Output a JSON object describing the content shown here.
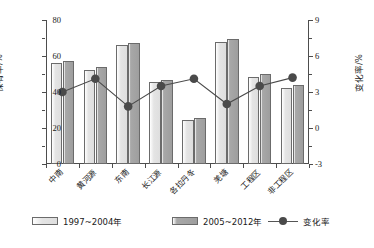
{
  "chart_data": {
    "type": "bar",
    "title": "",
    "xlabel": "",
    "ylabel": "保有率/%",
    "y2label": "变化率/%",
    "categories": [
      "中南",
      "黄河源",
      "东南",
      "长江源",
      "各拉丹冬",
      "羌塘",
      "工程区",
      "非工程区"
    ],
    "ylim": [
      0,
      80
    ],
    "yticks": [
      0,
      20,
      40,
      60,
      80
    ],
    "y2lim": [
      -3,
      9
    ],
    "y2ticks": [
      -3,
      0,
      3,
      6,
      9
    ],
    "grid": false,
    "legend_position": "bottom",
    "series": [
      {
        "name": "1997~2004年",
        "kind": "bar",
        "axis": "left",
        "color": "#e0e0e0",
        "values": [
          56.0,
          52.0,
          66.0,
          45.5,
          24.5,
          68.0,
          48.5,
          42.0
        ]
      },
      {
        "name": "2005~2012年",
        "kind": "bar",
        "axis": "left",
        "color": "#a0a0a0",
        "values": [
          57.5,
          54.0,
          67.0,
          46.5,
          25.5,
          69.5,
          50.0,
          44.0
        ]
      },
      {
        "name": "变化率",
        "kind": "line",
        "axis": "right",
        "color": "#4a4a4a",
        "values": [
          3.0,
          4.1,
          1.8,
          3.5,
          4.1,
          2.0,
          3.5,
          4.2
        ]
      }
    ]
  },
  "axes": {
    "left_title": "保有率/%",
    "right_title": "变化率/%",
    "left_ticks": [
      "80",
      "60",
      "40",
      "20",
      "0"
    ],
    "right_ticks": [
      "9",
      "6",
      "3",
      "0",
      "-3"
    ]
  },
  "legend": {
    "items": [
      {
        "label": "1997~2004年",
        "marker": "swatch-light"
      },
      {
        "label": "2005~2012年",
        "marker": "swatch-dark"
      },
      {
        "label": "变化率",
        "marker": "line-dot"
      }
    ]
  }
}
